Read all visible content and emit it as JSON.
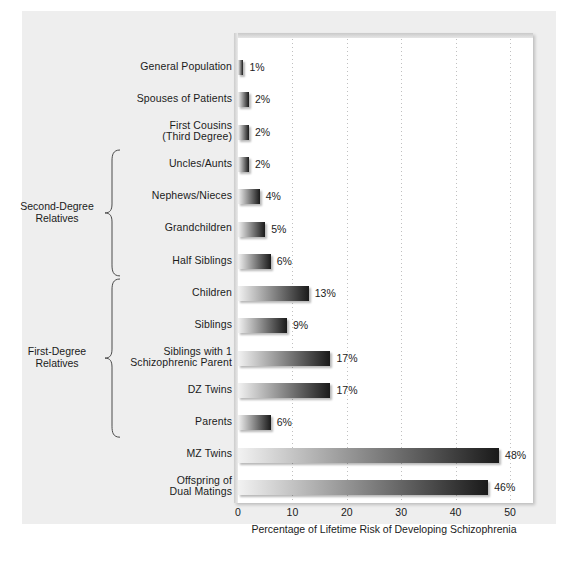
{
  "chart_data": {
    "type": "bar",
    "orientation": "horizontal",
    "title": "",
    "xlabel": "Percentage of Lifetime Risk of Developing Schizophrenia",
    "ylabel": "",
    "xlim": [
      0,
      55
    ],
    "xticks": [
      0,
      10,
      20,
      30,
      40,
      50
    ],
    "xtick_labels": [
      "0",
      "10",
      "20",
      "30",
      "40",
      "50"
    ],
    "grid": true,
    "grid_axis": "x",
    "legend": false,
    "value_suffix": "%",
    "categories": [
      "General Population",
      "Spouses of Patients",
      "First Cousins\n(Third Degree)",
      "Uncles/Aunts",
      "Nephews/Nieces",
      "Grandchildren",
      "Half Siblings",
      "Children",
      "Siblings",
      "Siblings with 1\nSchizophrenic Parent",
      "DZ Twins",
      "Parents",
      "MZ Twins",
      "Offspring of\nDual Matings"
    ],
    "values": [
      1,
      2,
      2,
      2,
      4,
      5,
      6,
      13,
      9,
      17,
      17,
      6,
      48,
      46
    ],
    "value_labels": [
      "1%",
      "2%",
      "2%",
      "2%",
      "4%",
      "5%",
      "6%",
      "13%",
      "9%",
      "17%",
      "17%",
      "6%",
      "48%",
      "46%"
    ],
    "groups": [
      {
        "label": "Second-Degree\nRelatives",
        "first_index": 3,
        "last_index": 6
      },
      {
        "label": "First-Degree\nRelatives",
        "first_index": 7,
        "last_index": 11
      }
    ],
    "colors": {
      "bar_gradient_start": "#f2f2f2",
      "bar_gradient_end": "#1a1a1a",
      "page_background": "#eeeeee",
      "plot_background": "#ffffff",
      "text": "#1b1b1b",
      "gridline": "#c0c0c0"
    }
  }
}
